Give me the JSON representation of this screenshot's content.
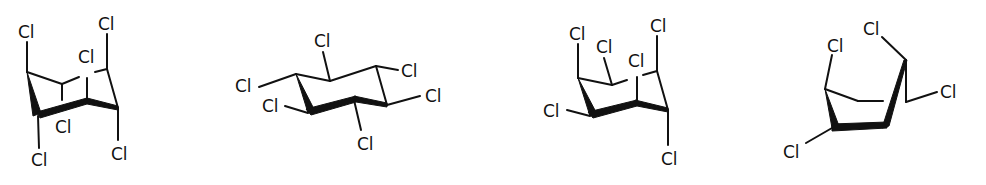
{
  "figure": {
    "structures": [
      {
        "id": "structure-1",
        "labels": [
          "Cl",
          "Cl",
          "Cl",
          "Cl",
          "Cl",
          "Cl"
        ]
      },
      {
        "id": "structure-2",
        "labels": [
          "Cl",
          "Cl",
          "Cl",
          "Cl",
          "Cl",
          "Cl"
        ]
      },
      {
        "id": "structure-3",
        "labels": [
          "Cl",
          "Cl",
          "Cl",
          "Cl",
          "Cl",
          "Cl",
          "Cl"
        ]
      },
      {
        "id": "structure-4",
        "labels": [
          "Cl",
          "Cl",
          "Cl",
          "Cl"
        ]
      }
    ]
  }
}
